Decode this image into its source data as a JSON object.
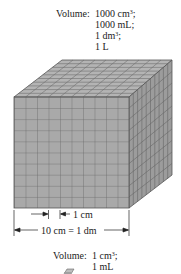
{
  "large_cube": {
    "volume_label": "Volume:",
    "volume_values": [
      {
        "text": "1000 cm",
        "sup": "3",
        "suffix": ";"
      },
      {
        "text": "1000 mL;",
        "sup": "",
        "suffix": ""
      },
      {
        "text": "1 dm",
        "sup": "3",
        "suffix": ";"
      },
      {
        "text": "1 L",
        "sup": "",
        "suffix": ""
      }
    ],
    "grid_divisions": 10,
    "face_color": "#a9a9a9",
    "line_color": "#5a5a5a"
  },
  "dimensions": {
    "small_unit": "1 cm",
    "edge_length": "10 cm = 1 dm"
  },
  "small_cube": {
    "volume_label": "Volume:",
    "volume_values": [
      {
        "text": "1 cm",
        "sup": "3",
        "suffix": ";"
      },
      {
        "text": "1 mL",
        "sup": "",
        "suffix": ""
      }
    ]
  }
}
